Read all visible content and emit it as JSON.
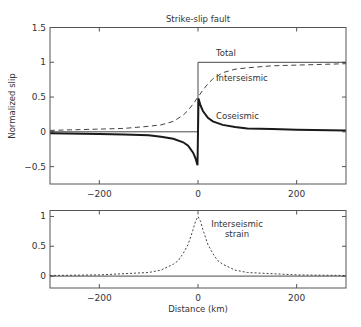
{
  "chart_data": [
    {
      "type": "line",
      "title": "Strike-slip fault",
      "xlabel": "",
      "ylabel": "Normalized slip",
      "xlim": [
        -300,
        300
      ],
      "ylim": [
        -0.75,
        1.5
      ],
      "xticks": [
        -200,
        0,
        200
      ],
      "xtick_labels": [
        "−200",
        "0",
        "200"
      ],
      "yticks": [
        -0.5,
        0,
        0.5,
        1,
        1.5
      ],
      "ytick_labels": [
        "−0.5",
        "0",
        "0.5",
        "1",
        "1.5"
      ],
      "grid": false,
      "legend": "none (inline annotations)",
      "annotations": [
        {
          "text": "Total",
          "x": 30,
          "y": 1.1
        },
        {
          "text": "Interseismic",
          "x": 25,
          "y": 0.8
        },
        {
          "text": "Coseismic",
          "x": 25,
          "y": 0.25
        }
      ],
      "series": [
        {
          "name": "Total",
          "style": "thin solid",
          "x": [
            -300,
            0,
            0,
            300
          ],
          "y": [
            0,
            0,
            1,
            1
          ]
        },
        {
          "name": "Interseismic",
          "style": "dashed",
          "x": [
            -300,
            -200,
            -150,
            -100,
            -75,
            -50,
            -30,
            -20,
            -10,
            0,
            10,
            20,
            30,
            50,
            75,
            100,
            150,
            200,
            300
          ],
          "y": [
            0.02,
            0.04,
            0.05,
            0.08,
            0.1,
            0.15,
            0.24,
            0.31,
            0.4,
            0.5,
            0.6,
            0.69,
            0.76,
            0.85,
            0.9,
            0.92,
            0.95,
            0.96,
            0.98
          ]
        },
        {
          "name": "Coseismic",
          "style": "thick solid",
          "x": [
            -300,
            -200,
            -150,
            -100,
            -75,
            -50,
            -30,
            -20,
            -10,
            -5,
            -1,
            1,
            5,
            10,
            20,
            30,
            50,
            75,
            100,
            150,
            200,
            300
          ],
          "y": [
            -0.02,
            -0.03,
            -0.04,
            -0.05,
            -0.07,
            -0.1,
            -0.15,
            -0.2,
            -0.3,
            -0.38,
            -0.48,
            0.48,
            0.38,
            0.3,
            0.2,
            0.15,
            0.1,
            0.07,
            0.05,
            0.04,
            0.03,
            0.02
          ]
        }
      ]
    },
    {
      "type": "line",
      "title": "",
      "xlabel": "Distance (km)",
      "ylabel": "",
      "xlim": [
        -300,
        300
      ],
      "ylim": [
        -0.2,
        1.1
      ],
      "xticks": [
        -200,
        0,
        200
      ],
      "xtick_labels": [
        "−200",
        "0",
        "200"
      ],
      "yticks": [
        0,
        0.5,
        1
      ],
      "ytick_labels": [
        "0",
        "0.5",
        "1"
      ],
      "grid": false,
      "annotations": [
        {
          "text": "Interseismic",
          "line2": "strain",
          "x": 15,
          "y": 0.85
        }
      ],
      "series": [
        {
          "name": "Zero line",
          "style": "thin solid",
          "x": [
            -300,
            300
          ],
          "y": [
            0,
            0
          ]
        },
        {
          "name": "Interseismic strain",
          "style": "dotted",
          "x": [
            -300,
            -200,
            -150,
            -100,
            -75,
            -50,
            -40,
            -30,
            -20,
            -10,
            -5,
            0,
            5,
            10,
            20,
            30,
            40,
            50,
            75,
            100,
            150,
            200,
            300
          ],
          "y": [
            0.01,
            0.02,
            0.04,
            0.06,
            0.1,
            0.2,
            0.26,
            0.38,
            0.53,
            0.78,
            0.92,
            1.0,
            0.92,
            0.78,
            0.53,
            0.38,
            0.26,
            0.2,
            0.1,
            0.06,
            0.04,
            0.02,
            0.01
          ]
        }
      ]
    }
  ]
}
